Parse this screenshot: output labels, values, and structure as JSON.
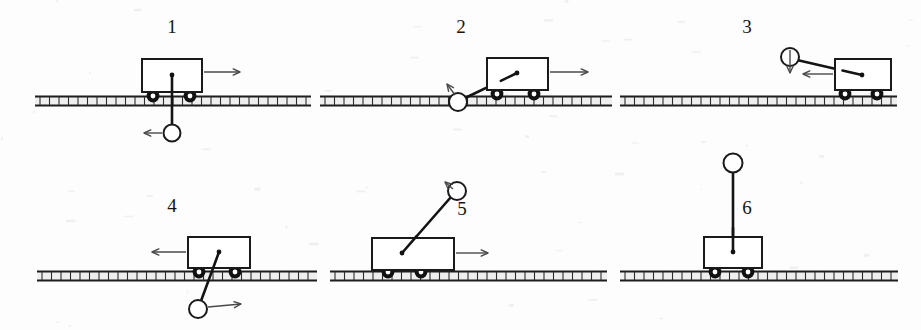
{
  "figure": {
    "panel_count": 6,
    "canvas": {
      "width": 921,
      "height": 330
    },
    "background_color": "#fdfdfd",
    "line_color": "#1a1a1a",
    "arrow_color": "#4a4a4a"
  },
  "panels": [
    {
      "label": "1",
      "label_x": 172,
      "label_y": 33,
      "rail": {
        "x1": 35,
        "x2": 311,
        "y": 101
      },
      "cart": {
        "x": 142,
        "y": 59,
        "w": 60,
        "h": 33
      },
      "cart_pivot": {
        "x": 172,
        "y": 75
      },
      "wheels": [
        {
          "cx": 153,
          "cy": 96
        },
        {
          "cx": 190,
          "cy": 96
        }
      ],
      "ball": {
        "cx": 172,
        "cy": 133,
        "r": 8.5
      },
      "rod": {
        "x1": 172,
        "y1": 75,
        "x2": 172,
        "y2": 126
      },
      "cart_arrow": {
        "x1": 204,
        "y1": 72,
        "x2": 240,
        "y2": 72,
        "direction": "right"
      },
      "ball_arrow": {
        "x1": 162,
        "y1": 133,
        "x2": 144,
        "y2": 133,
        "direction": "left"
      },
      "description": "ball hanging straight down below cart, cart moving right, ball force left"
    },
    {
      "label": "2",
      "label_x": 461,
      "label_y": 33,
      "rail": {
        "x1": 320,
        "x2": 612,
        "y": 101
      },
      "cart": {
        "x": 487,
        "y": 58,
        "w": 61,
        "h": 32
      },
      "cart_pivot": {
        "x": 517,
        "y": 73
      },
      "wheels": [
        {
          "cx": 497,
          "cy": 94
        },
        {
          "cx": 534,
          "cy": 94
        }
      ],
      "ball": {
        "cx": 458,
        "cy": 102,
        "r": 9
      },
      "rod": {
        "x1": 517,
        "y1": 73,
        "x2": 463,
        "y2": 99
      },
      "cart_arrow": {
        "x1": 550,
        "y1": 72,
        "x2": 588,
        "y2": 72,
        "direction": "right"
      },
      "ball_arrow": {
        "x1": 455,
        "y1": 95,
        "x2": 447,
        "y2": 84,
        "direction": "up-left"
      },
      "description": "ball on rail level to the left, rod up-right to cart, cart moving right"
    },
    {
      "label": "3",
      "label_x": 747,
      "label_y": 33,
      "rail": {
        "x1": 620,
        "x2": 897,
        "y": 101
      },
      "cart": {
        "x": 835,
        "y": 59,
        "w": 56,
        "h": 31
      },
      "cart_pivot": {
        "x": 862,
        "y": 75
      },
      "wheels": [
        {
          "cx": 845,
          "cy": 94
        },
        {
          "cx": 877,
          "cy": 94
        }
      ],
      "ball": {
        "cx": 790,
        "cy": 57,
        "r": 9
      },
      "rod": {
        "x1": 862,
        "y1": 75,
        "x2": 797,
        "y2": 60
      },
      "cart_arrow": {
        "x1": 833,
        "y1": 74,
        "x2": 803,
        "y2": 74,
        "direction": "left"
      },
      "ball_arrow": {
        "x1": 790,
        "y1": 50,
        "x2": 790,
        "y2": 73,
        "direction": "down"
      },
      "description": "ball up-left of cart at cart-top height, cart moving left, ball force down"
    },
    {
      "label": "4",
      "label_x": 172,
      "label_y": 212,
      "rail": {
        "x1": 37,
        "x2": 317,
        "y": 276
      },
      "cart": {
        "x": 188,
        "y": 237,
        "w": 62,
        "h": 31
      },
      "cart_pivot": {
        "x": 219,
        "y": 252
      },
      "wheels": [
        {
          "cx": 199,
          "cy": 272
        },
        {
          "cx": 235,
          "cy": 272
        }
      ],
      "ball": {
        "cx": 198,
        "cy": 309,
        "r": 9
      },
      "rod": {
        "x1": 219,
        "y1": 252,
        "x2": 201,
        "y2": 301
      },
      "cart_arrow": {
        "x1": 186,
        "y1": 252,
        "x2": 152,
        "y2": 252,
        "direction": "left"
      },
      "ball_arrow": {
        "x1": 208,
        "y1": 307,
        "x2": 241,
        "y2": 304,
        "direction": "right"
      },
      "description": "ball below and left of cart, cart moving left, ball force right"
    },
    {
      "label": "5",
      "label_x": 462,
      "label_y": 215,
      "rail": {
        "x1": 330,
        "x2": 607,
        "y": 276
      },
      "cart": {
        "x": 372,
        "y": 238,
        "w": 82,
        "h": 32
      },
      "cart_pivot": {
        "x": 402,
        "y": 253
      },
      "wheels": [
        {
          "cx": 388,
          "cy": 272
        },
        {
          "cx": 421,
          "cy": 272
        }
      ],
      "ball": {
        "cx": 457,
        "cy": 191,
        "r": 9
      },
      "rod": {
        "x1": 402,
        "y1": 253,
        "x2": 451,
        "y2": 197
      },
      "cart_arrow": {
        "x1": 456,
        "y1": 253,
        "x2": 488,
        "y2": 253,
        "direction": "right"
      },
      "ball_arrow": {
        "x1": 453,
        "y1": 189,
        "x2": 445,
        "y2": 182,
        "direction": "up-left"
      },
      "description": "ball up-right above cart, cart moving right"
    },
    {
      "label": "6",
      "label_x": 747,
      "label_y": 214,
      "rail": {
        "x1": 620,
        "x2": 898,
        "y": 276
      },
      "cart": {
        "x": 704,
        "y": 237,
        "w": 58,
        "h": 31
      },
      "cart_pivot": {
        "x": 733,
        "y": 252
      },
      "wheels": [
        {
          "cx": 715,
          "cy": 272
        },
        {
          "cx": 748,
          "cy": 272
        }
      ],
      "ball": {
        "cx": 733,
        "cy": 163,
        "r": 9.5
      },
      "rod": {
        "x1": 733,
        "y1": 252,
        "x2": 733,
        "y2": 172
      },
      "cart_arrow": null,
      "ball_arrow": null,
      "description": "ball balanced straight up above cart, no motion arrows"
    }
  ]
}
